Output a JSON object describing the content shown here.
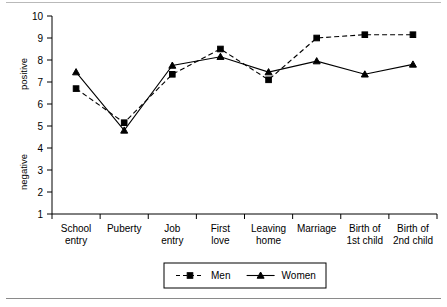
{
  "chart_data": {
    "type": "line",
    "title": "",
    "subtitle": "",
    "xlabel": "",
    "ylabel": "",
    "ylim": [
      1,
      10
    ],
    "yticks": [
      1,
      2,
      3,
      4,
      5,
      6,
      7,
      8,
      9,
      10
    ],
    "grid": false,
    "legend_position": "bottom",
    "axis_labels": {
      "y_top": "positive",
      "y_bottom": "negative"
    },
    "categories": [
      "School entry",
      "Puberty",
      "Job entry",
      "First love",
      "Leaving home",
      "Marriage",
      "Birth of 1st child",
      "Birth of 2nd child"
    ],
    "categories_lines": [
      [
        "School",
        "entry"
      ],
      [
        "Puberty",
        ""
      ],
      [
        "Job",
        "entry"
      ],
      [
        "First",
        "love"
      ],
      [
        "Leaving",
        "home"
      ],
      [
        "Marriage",
        ""
      ],
      [
        "Birth of",
        "1st child"
      ],
      [
        "Birth of",
        "2nd child"
      ]
    ],
    "series": [
      {
        "name": "Men",
        "marker": "square",
        "line_style": "dashed",
        "color": "#000000",
        "values": [
          6.7,
          5.15,
          7.35,
          8.5,
          7.1,
          9.0,
          9.15,
          9.15
        ]
      },
      {
        "name": "Women",
        "marker": "triangle",
        "line_style": "solid",
        "color": "#000000",
        "values": [
          7.45,
          4.8,
          7.75,
          8.15,
          7.45,
          7.95,
          7.35,
          7.8
        ]
      }
    ],
    "legend": [
      {
        "label": "Men",
        "marker": "square",
        "line_style": "dashed"
      },
      {
        "label": "Women",
        "marker": "triangle",
        "line_style": "solid"
      }
    ]
  },
  "colors": {
    "ink": "#000000",
    "rule": "#8a8a8a",
    "background": "#ffffff"
  }
}
